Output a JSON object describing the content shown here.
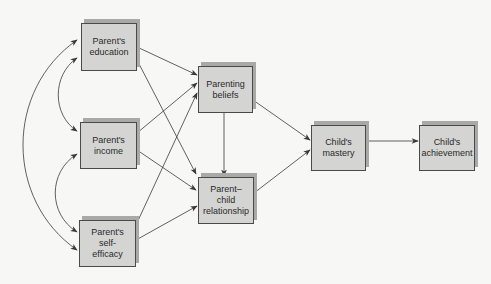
{
  "diagram": {
    "type": "path-model",
    "colors": {
      "background": "#f7f7f5",
      "box_fill": "#d4d4d2",
      "box_shadow": "#a9a9a9",
      "box_border": "#4a4a4a",
      "line": "#3a3a3a",
      "text": "#2a2a2a"
    },
    "nodes": [
      {
        "id": "education",
        "label": "Parent's\neducation",
        "x": 81,
        "y": 23,
        "w": 56,
        "h": 48
      },
      {
        "id": "income",
        "label": "Parent's\nincome",
        "x": 80,
        "y": 122,
        "w": 57,
        "h": 47
      },
      {
        "id": "self_efficacy",
        "label": "Parent's\nself-\nefficacy",
        "x": 79,
        "y": 220,
        "w": 57,
        "h": 47
      },
      {
        "id": "beliefs",
        "label": "Parenting\nbeliefs",
        "x": 198,
        "y": 66,
        "w": 55,
        "h": 47
      },
      {
        "id": "parent_child",
        "label": "Parent–\nchild\nrelationship",
        "x": 198,
        "y": 177,
        "w": 56,
        "h": 47
      },
      {
        "id": "mastery",
        "label": "Child's\nmastery",
        "x": 311,
        "y": 125,
        "w": 55,
        "h": 46
      },
      {
        "id": "achievement",
        "label": "Child's\nachievement",
        "x": 419,
        "y": 125,
        "w": 56,
        "h": 46
      }
    ],
    "edges": [
      {
        "from": "education",
        "to": "beliefs",
        "kind": "directed"
      },
      {
        "from": "education",
        "to": "parent_child",
        "kind": "directed"
      },
      {
        "from": "income",
        "to": "beliefs",
        "kind": "directed"
      },
      {
        "from": "income",
        "to": "parent_child",
        "kind": "directed"
      },
      {
        "from": "self_efficacy",
        "to": "beliefs",
        "kind": "directed"
      },
      {
        "from": "self_efficacy",
        "to": "parent_child",
        "kind": "directed"
      },
      {
        "from": "beliefs",
        "to": "parent_child",
        "kind": "directed"
      },
      {
        "from": "beliefs",
        "to": "mastery",
        "kind": "directed"
      },
      {
        "from": "parent_child",
        "to": "mastery",
        "kind": "directed"
      },
      {
        "from": "mastery",
        "to": "achievement",
        "kind": "directed"
      },
      {
        "from": "education",
        "to": "income",
        "kind": "correlation"
      },
      {
        "from": "income",
        "to": "self_efficacy",
        "kind": "correlation"
      },
      {
        "from": "education",
        "to": "self_efficacy",
        "kind": "correlation"
      }
    ]
  }
}
